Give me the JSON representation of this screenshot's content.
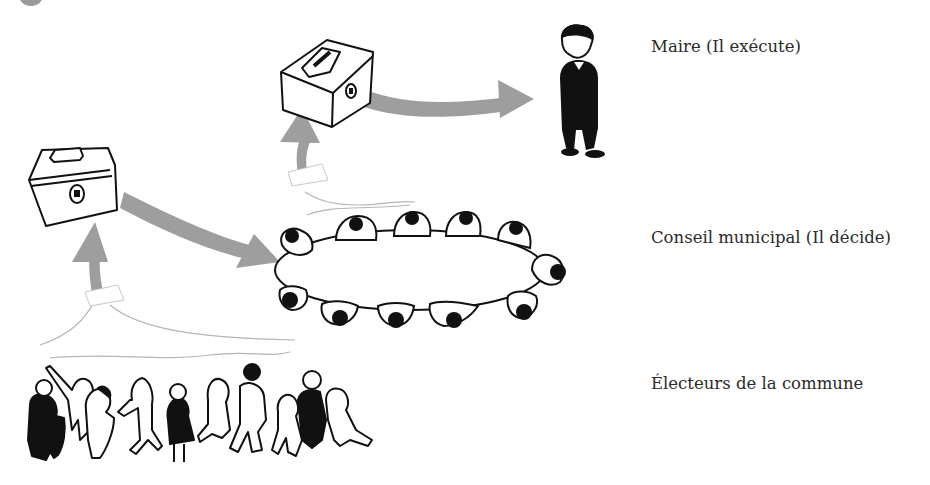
{
  "diagram": {
    "type": "organizational-flow",
    "levels": [
      {
        "id": "maire",
        "label": "Maire (Il exécute)",
        "icon": "mayor-figure-icon"
      },
      {
        "id": "conseil",
        "label": "Conseil municipal (Il décide)",
        "icon": "council-table-icon"
      },
      {
        "id": "electeurs",
        "label": "Électeurs de la commune",
        "icon": "voters-crowd-icon"
      }
    ],
    "flows": [
      {
        "from": "electeurs",
        "to": "ballot-box-1",
        "icon": "arrow-up-icon"
      },
      {
        "from": "ballot-box-1",
        "to": "conseil",
        "icon": "arrow-right-icon"
      },
      {
        "from": "conseil",
        "to": "ballot-box-2",
        "icon": "arrow-up-icon"
      },
      {
        "from": "ballot-box-2",
        "to": "maire",
        "icon": "arrow-right-icon"
      }
    ],
    "colors": {
      "arrow": "#9e9e9e",
      "ink": "#111111",
      "text": "#2a2a2a",
      "background": "#ffffff"
    }
  }
}
